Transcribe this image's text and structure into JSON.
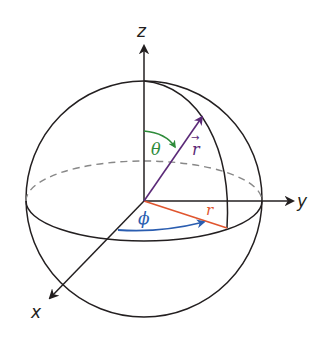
{
  "diagram": {
    "type": "3d-coordinate-sphere",
    "axes": {
      "z": {
        "label": "z"
      },
      "y": {
        "label": "y"
      },
      "x": {
        "label": "x"
      }
    },
    "annotations": {
      "theta": {
        "label": "θ",
        "color": "#2e8b3a",
        "meaning": "polar angle from z-axis"
      },
      "phi": {
        "label": "ϕ",
        "color": "#2a5db0",
        "meaning": "azimuthal angle from x-axis"
      },
      "r_vector": {
        "label": "r",
        "arrow": "→",
        "color": "#5b2a78",
        "meaning": "position vector"
      },
      "r_projection": {
        "label": "r",
        "color": "#e0552e",
        "meaning": "projection in xy-plane"
      }
    },
    "colors": {
      "outline": "#231f20",
      "dashed": "#888888",
      "theta": "#2e8b3a",
      "phi": "#2a5db0",
      "vector": "#5b2a78",
      "projection": "#e0552e"
    }
  }
}
